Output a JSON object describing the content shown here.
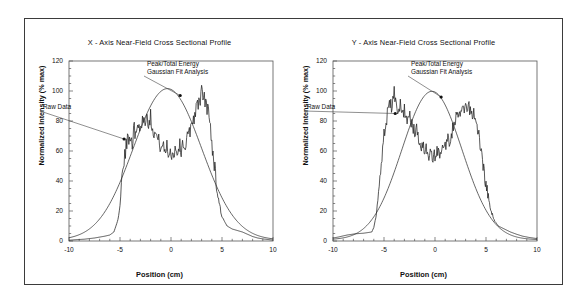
{
  "figure": {
    "border_color": "#3b3b3b",
    "background": "#ffffff"
  },
  "panels": [
    {
      "id": "x-axis-panel",
      "title": "X - Axis Near-Field Cross Sectional Profile",
      "xlabel": "Position (cm)",
      "ylabel": "Normalized Intensity (% max)",
      "annotations": [
        {
          "name": "raw-data",
          "lines": [
            "Raw Data"
          ],
          "text_x": 18,
          "text_y": 90,
          "anchor": "start",
          "point_x": -4.6,
          "point_y": 68
        },
        {
          "name": "gaussian-fit",
          "lines": [
            "Peak/Total Energy",
            "Gaussian Fit Analysis"
          ],
          "text_x": 122,
          "text_y": 47,
          "anchor": "start",
          "point_x": 0.9,
          "point_y": 97
        }
      ]
    },
    {
      "id": "y-axis-panel",
      "title": "Y - Axis Near-Field Cross Sectional Profile",
      "xlabel": "Position (cm)",
      "ylabel": "Normalized Intensity (% max)",
      "annotations": [
        {
          "name": "raw-data",
          "lines": [
            "Raw Data"
          ],
          "text_x": 18,
          "text_y": 90,
          "anchor": "start",
          "point_x": -3.9,
          "point_y": 85
        },
        {
          "name": "gaussian-fit",
          "lines": [
            "Peak/Total Energy",
            "Gaussian Fit Analysis"
          ],
          "text_x": 122,
          "text_y": 47,
          "anchor": "start",
          "point_x": 0.6,
          "point_y": 96
        }
      ]
    }
  ],
  "chart_data": [
    {
      "type": "line",
      "id": "x-axis-profile",
      "title": "X - Axis Near-Field Cross Sectional Profile",
      "xlabel": "Position (cm)",
      "ylabel": "Normalized Intensity (% max)",
      "xlim": [
        -10,
        10
      ],
      "ylim": [
        0,
        120
      ],
      "xticks": [
        -10,
        -5,
        0,
        5,
        10
      ],
      "yticks": [
        0,
        20,
        40,
        60,
        80,
        100,
        120
      ],
      "x_minor_step": 1,
      "y_minor_step": 5,
      "grid": false,
      "legend": "none",
      "series": [
        {
          "name": "Gaussian Fit Analysis",
          "style": "smooth",
          "color": "#333333",
          "model": {
            "kind": "gaussian",
            "amplitude": 101,
            "center": -0.35,
            "sigma": 3.35,
            "baseline": 0.6
          }
        },
        {
          "name": "Raw Data",
          "style": "noisy",
          "color": "#222222",
          "noise_amplitude": 5.5,
          "noise_seed": 17,
          "x": [
            -10.0,
            -9.5,
            -9.0,
            -8.5,
            -8.0,
            -7.5,
            -7.0,
            -6.5,
            -6.0,
            -5.6,
            -5.2,
            -5.0,
            -4.8,
            -4.6,
            -4.4,
            -4.2,
            -4.0,
            -3.8,
            -3.6,
            -3.4,
            -3.2,
            -3.0,
            -2.8,
            -2.6,
            -2.4,
            -2.2,
            -2.0,
            -1.8,
            -1.6,
            -1.4,
            -1.2,
            -1.0,
            -0.8,
            -0.6,
            -0.4,
            -0.2,
            0.0,
            0.2,
            0.4,
            0.6,
            0.8,
            1.0,
            1.2,
            1.4,
            1.6,
            1.8,
            2.0,
            2.2,
            2.4,
            2.6,
            2.8,
            3.0,
            3.2,
            3.4,
            3.6,
            3.8,
            4.0,
            4.3,
            4.6,
            5.0,
            5.5,
            6.0,
            6.5,
            7.0,
            7.5,
            8.0,
            8.5,
            9.0,
            9.5,
            10.0
          ],
          "y": [
            0.5,
            0.8,
            1.0,
            1.2,
            1.6,
            2.0,
            2.6,
            3.2,
            4.0,
            6.0,
            14.0,
            26.0,
            42.0,
            52.0,
            63.0,
            68.0,
            72.0,
            66.0,
            75.0,
            70.0,
            80.0,
            74.0,
            82.0,
            79.0,
            84.0,
            80.0,
            83.0,
            76.0,
            72.0,
            70.0,
            66.0,
            64.0,
            62.0,
            60.0,
            63.0,
            58.0,
            60.0,
            57.0,
            62.0,
            59.0,
            64.0,
            61.0,
            66.0,
            63.0,
            68.0,
            72.0,
            78.0,
            82.0,
            86.0,
            90.0,
            94.0,
            99.0,
            96.0,
            92.0,
            88.0,
            80.0,
            66.0,
            48.0,
            30.0,
            16.0,
            10.0,
            8.0,
            7.0,
            6.0,
            4.5,
            3.0,
            2.0,
            1.4,
            1.0,
            0.6
          ]
        }
      ]
    },
    {
      "type": "line",
      "id": "y-axis-profile",
      "title": "Y - Axis Near-Field Cross Sectional Profile",
      "xlabel": "Position (cm)",
      "ylabel": "Normalized Intensity (% max)",
      "xlim": [
        -10,
        10
      ],
      "ylim": [
        0,
        120
      ],
      "xticks": [
        -10,
        -5,
        0,
        5,
        10
      ],
      "yticks": [
        0,
        20,
        40,
        60,
        80,
        100,
        120
      ],
      "x_minor_step": 1,
      "y_minor_step": 5,
      "grid": false,
      "legend": "none",
      "series": [
        {
          "name": "Gaussian Fit Analysis",
          "style": "smooth",
          "color": "#333333",
          "model": {
            "kind": "gaussian",
            "amplitude": 99,
            "center": -0.3,
            "sigma": 2.95,
            "baseline": 0.8
          }
        },
        {
          "name": "Raw Data",
          "style": "noisy",
          "color": "#222222",
          "noise_amplitude": 5.0,
          "noise_seed": 29,
          "x": [
            -10.0,
            -9.5,
            -9.0,
            -8.6,
            -8.2,
            -7.8,
            -7.4,
            -7.0,
            -6.6,
            -6.2,
            -6.0,
            -5.8,
            -5.6,
            -5.4,
            -5.2,
            -5.0,
            -4.8,
            -4.6,
            -4.4,
            -4.2,
            -4.0,
            -3.8,
            -3.6,
            -3.4,
            -3.2,
            -3.0,
            -2.8,
            -2.6,
            -2.4,
            -2.2,
            -2.0,
            -1.8,
            -1.6,
            -1.4,
            -1.2,
            -1.0,
            -0.8,
            -0.6,
            -0.4,
            -0.2,
            0.0,
            0.2,
            0.4,
            0.6,
            0.8,
            1.0,
            1.2,
            1.4,
            1.6,
            1.8,
            2.0,
            2.2,
            2.4,
            2.6,
            2.8,
            3.0,
            3.2,
            3.4,
            3.6,
            3.8,
            4.0,
            4.3,
            4.6,
            5.0,
            5.4,
            5.8,
            6.2,
            6.8,
            7.4,
            8.0,
            8.6,
            9.2,
            10.0
          ],
          "y": [
            2.0,
            2.6,
            3.4,
            4.0,
            4.4,
            4.8,
            5.0,
            5.2,
            5.6,
            6.0,
            9.0,
            16.0,
            28.0,
            44.0,
            58.0,
            70.0,
            80.0,
            86.0,
            92.0,
            88.0,
            100.0,
            92.0,
            86.0,
            90.0,
            84.0,
            88.0,
            82.0,
            80.0,
            83.0,
            76.0,
            72.0,
            74.0,
            68.0,
            64.0,
            66.0,
            60.0,
            62.0,
            57.0,
            58.0,
            55.0,
            58.0,
            60.0,
            57.0,
            62.0,
            59.0,
            64.0,
            68.0,
            66.0,
            72.0,
            76.0,
            80.0,
            84.0,
            82.0,
            88.0,
            85.0,
            90.0,
            86.0,
            89.0,
            84.0,
            86.0,
            80.0,
            70.0,
            56.0,
            38.0,
            22.0,
            14.0,
            10.0,
            8.0,
            6.0,
            4.5,
            3.2,
            2.4,
            1.6
          ]
        }
      ]
    }
  ]
}
